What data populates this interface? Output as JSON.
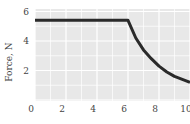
{
  "chart_data": {
    "type": "line",
    "title": "",
    "xlabel": "",
    "ylabel": "Force, N",
    "xlim": [
      0,
      10
    ],
    "ylim": [
      0,
      6
    ],
    "grid": true,
    "x_ticks": [
      "0",
      "2",
      "4",
      "6",
      "8",
      "10"
    ],
    "y_ticks": [
      "2",
      "4",
      "6"
    ],
    "series": [
      {
        "name": "Force",
        "x": [
          0,
          6,
          6.5,
          7,
          7.5,
          8,
          8.5,
          9,
          9.5,
          10
        ],
        "values": [
          5.4,
          5.4,
          4.2,
          3.4,
          2.8,
          2.3,
          1.9,
          1.6,
          1.4,
          1.2
        ],
        "color": "#2a2a2a"
      }
    ],
    "colors": {
      "plot_bg": "#e8e8e8",
      "grid": "#ffffff",
      "line": "#2a2a2a"
    }
  }
}
